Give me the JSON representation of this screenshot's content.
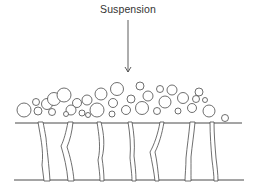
{
  "diagram": {
    "title": "Suspension",
    "colors": {
      "stroke": "#4a4a4a",
      "background": "#ffffff",
      "text": "#333333"
    },
    "arrow": {
      "x": 128,
      "y1": 20,
      "y2": 72
    },
    "membrane": {
      "top_line": {
        "x1": 15,
        "x2": 242,
        "y": 123
      },
      "bottom_line": {
        "x1": 14,
        "x2": 244,
        "y": 180
      }
    },
    "particles": [
      {
        "cx": 24,
        "cy": 110,
        "r": 7
      },
      {
        "cx": 36,
        "cy": 102,
        "r": 3.5
      },
      {
        "cx": 38,
        "cy": 111,
        "r": 4
      },
      {
        "cx": 47,
        "cy": 104,
        "r": 5.5
      },
      {
        "cx": 54,
        "cy": 99,
        "r": 6.5
      },
      {
        "cx": 52,
        "cy": 112,
        "r": 3.5
      },
      {
        "cx": 64,
        "cy": 95,
        "r": 7
      },
      {
        "cx": 71,
        "cy": 110,
        "r": 5
      },
      {
        "cx": 77,
        "cy": 103,
        "r": 4.5
      },
      {
        "cx": 82,
        "cy": 113,
        "r": 3
      },
      {
        "cx": 87,
        "cy": 100,
        "r": 5
      },
      {
        "cx": 97,
        "cy": 110,
        "r": 7
      },
      {
        "cx": 101,
        "cy": 94,
        "r": 6
      },
      {
        "cx": 113,
        "cy": 103,
        "r": 4.5
      },
      {
        "cx": 117,
        "cy": 89,
        "r": 6.5
      },
      {
        "cx": 112,
        "cy": 114,
        "r": 3
      },
      {
        "cx": 126,
        "cy": 110,
        "r": 4.5
      },
      {
        "cx": 131,
        "cy": 99,
        "r": 4
      },
      {
        "cx": 142,
        "cy": 108,
        "r": 6.5
      },
      {
        "cx": 148,
        "cy": 96,
        "r": 5
      },
      {
        "cx": 157,
        "cy": 111,
        "r": 3.5
      },
      {
        "cx": 165,
        "cy": 102,
        "r": 6
      },
      {
        "cx": 172,
        "cy": 90,
        "r": 5
      },
      {
        "cx": 178,
        "cy": 111,
        "r": 3
      },
      {
        "cx": 183,
        "cy": 98,
        "r": 5.5
      },
      {
        "cx": 192,
        "cy": 108,
        "r": 4.5
      },
      {
        "cx": 196,
        "cy": 99,
        "r": 3.5
      },
      {
        "cx": 199,
        "cy": 92,
        "r": 4
      },
      {
        "cx": 209,
        "cy": 111,
        "r": 6
      },
      {
        "cx": 225,
        "cy": 118,
        "r": 3.5
      },
      {
        "cx": 140,
        "cy": 86,
        "r": 4
      },
      {
        "cx": 160,
        "cy": 89,
        "r": 3.5
      },
      {
        "cx": 88,
        "cy": 115,
        "r": 2.5
      },
      {
        "cx": 66,
        "cy": 114,
        "r": 2.5
      },
      {
        "cx": 205,
        "cy": 100,
        "r": 2.5
      }
    ]
  }
}
